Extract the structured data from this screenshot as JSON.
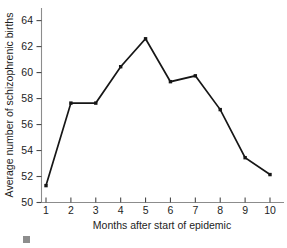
{
  "chart_data": {
    "type": "line",
    "title": "",
    "xlabel": "Months after start of epidemic",
    "ylabel": "Average number of schizophrenic births",
    "x": [
      1,
      2,
      3,
      4,
      5,
      6,
      7,
      8,
      9,
      10
    ],
    "categories": [
      "1",
      "2",
      "3",
      "4",
      "5",
      "6",
      "7",
      "8",
      "9",
      "10"
    ],
    "values": [
      51.3,
      57.65,
      57.65,
      60.45,
      62.6,
      59.3,
      59.75,
      57.15,
      53.45,
      52.15
    ],
    "series": [
      {
        "name": "Average number of schizophrenic births",
        "values": [
          51.3,
          57.65,
          57.65,
          60.45,
          62.6,
          59.3,
          59.75,
          57.15,
          53.45,
          52.15
        ]
      }
    ],
    "xlim": [
      1,
      10
    ],
    "ylim": [
      50,
      65
    ],
    "yticks": [
      50,
      52,
      54,
      56,
      58,
      60,
      62,
      64
    ],
    "ytick_labels": [
      "50",
      "52",
      "54",
      "56",
      "58",
      "60",
      "62",
      "64"
    ],
    "xticks": [
      1,
      2,
      3,
      4,
      5,
      6,
      7,
      8,
      9,
      10
    ],
    "xtick_labels": [
      "1",
      "2",
      "3",
      "4",
      "5",
      "6",
      "7",
      "8",
      "9",
      "10"
    ],
    "grid": false,
    "legend": false,
    "legend_position": "none",
    "marker": "filled-square",
    "line_color": "#161616",
    "marker_color": "#161616",
    "axis_color": "#8c8c8c",
    "background_color": "#ffffff",
    "annotations": []
  },
  "decoration": {
    "corner_swatch_color": "#8d8d8d"
  }
}
